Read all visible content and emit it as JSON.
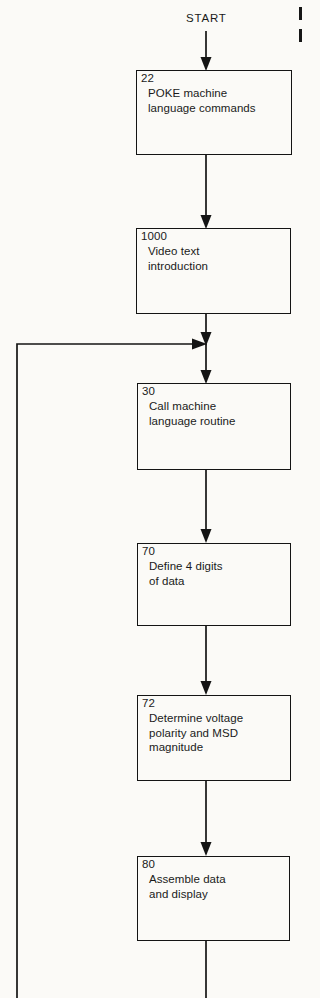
{
  "diagram": {
    "title_label": "START",
    "background_color": "#fbfaf7",
    "line_color": "#141414",
    "nodes": [
      {
        "id": "node-22",
        "step": "22",
        "text": "POKE machine\nlanguage commands",
        "x": 136,
        "y": 70,
        "w": 156,
        "h": 85
      },
      {
        "id": "node-1000",
        "step": "1000",
        "text": "Video text\nintroduction",
        "x": 136,
        "y": 228,
        "w": 155,
        "h": 86
      },
      {
        "id": "node-30",
        "step": "30",
        "text": "Call machine\nlanguage routine",
        "x": 137,
        "y": 383,
        "w": 154,
        "h": 87
      },
      {
        "id": "node-70",
        "step": "70",
        "text": "Define 4 digits\nof data",
        "x": 137,
        "y": 543,
        "w": 154,
        "h": 83
      },
      {
        "id": "node-72",
        "step": "72",
        "text": "Determine voltage\npolarity and MSD\nmagnitude",
        "x": 137,
        "y": 695,
        "w": 154,
        "h": 86
      },
      {
        "id": "node-80",
        "step": "80",
        "text": "Assemble data\nand display",
        "x": 137,
        "y": 856,
        "w": 153,
        "h": 85
      }
    ],
    "connectors": [
      {
        "id": "start-to-22",
        "from": "START",
        "to": "22"
      },
      {
        "id": "22-to-1000",
        "from": "22",
        "to": "1000"
      },
      {
        "id": "1000-to-merge",
        "from": "1000",
        "to": "merge-junction"
      },
      {
        "id": "feedback-to-merge",
        "from": "loop-return",
        "to": "merge-junction"
      },
      {
        "id": "merge-to-30",
        "from": "merge-junction",
        "to": "30"
      },
      {
        "id": "30-to-70",
        "from": "30",
        "to": "70"
      },
      {
        "id": "70-to-72",
        "from": "70",
        "to": "72"
      },
      {
        "id": "72-to-80",
        "from": "72",
        "to": "80"
      },
      {
        "id": "80-to-loop",
        "from": "80",
        "to": "loop-return"
      }
    ],
    "start_label_position": {
      "x": 186,
      "y": 12
    }
  }
}
